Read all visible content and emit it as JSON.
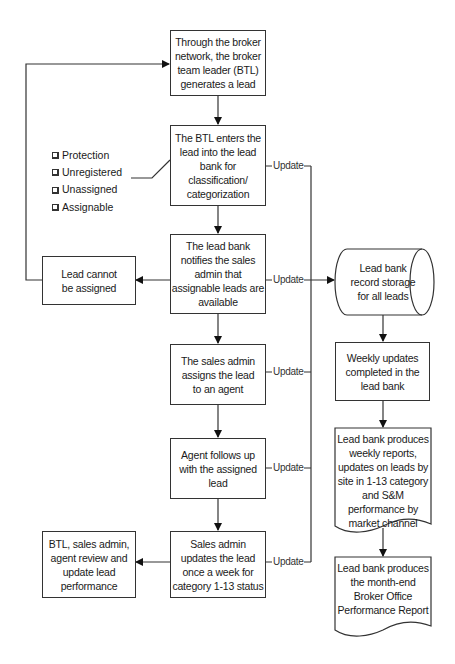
{
  "diagram": {
    "type": "flowchart",
    "nodes": {
      "generate_lead": "Through the broker network, the broker team leader (BTL) generates a lead",
      "enter_lead": "The BTL enters the lead into the lead bank for classification/ categorization",
      "notify_admin": "The lead bank notifies the sales admin that assignable leads are available",
      "cannot_assign": "Lead cannot be assigned",
      "assign_agent": "The sales admin assigns the lead to an agent",
      "agent_follow": "Agent follows up with the assigned lead",
      "admin_update": "Sales admin updates the lead once a week for category 1-13 status",
      "review": "BTL, sales admin, agent review and update lead performance",
      "storage": "Lead bank record storage for all leads",
      "weekly_updates": "Weekly updates completed in the lead bank",
      "weekly_reports": "Lead bank produces weekly reports, updates on leads by site in 1-13 category and S&M performance by market channel",
      "month_end": "Lead bank produces the month-end Broker Office Performance Report"
    },
    "categories": [
      "Protection",
      "Unregistered",
      "Unassigned",
      "Assignable"
    ],
    "edge_labels": {
      "update_1": "Update",
      "update_2": "Update",
      "update_3": "Update",
      "update_4": "Update",
      "update_5": "Update"
    }
  }
}
